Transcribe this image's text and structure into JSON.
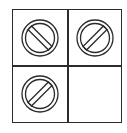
{
  "diagram": {
    "type": "2x2-grid",
    "colors": {
      "line": "#2b2b2b",
      "background": "#ffffff"
    },
    "cells": [
      {
        "row": 0,
        "col": 0,
        "icon": "prohibited-icon",
        "bar_direction": "backslash",
        "empty": false
      },
      {
        "row": 0,
        "col": 1,
        "icon": "prohibited-icon",
        "bar_direction": "slash",
        "empty": false
      },
      {
        "row": 1,
        "col": 0,
        "icon": "prohibited-icon",
        "bar_direction": "slash",
        "empty": false
      },
      {
        "row": 1,
        "col": 1,
        "icon": null,
        "bar_direction": null,
        "empty": true
      }
    ]
  }
}
